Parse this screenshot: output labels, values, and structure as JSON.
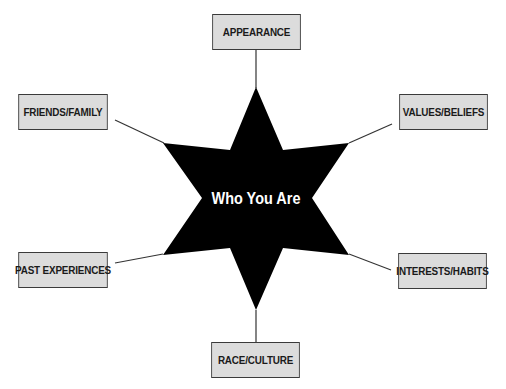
{
  "diagram": {
    "center": {
      "label": "Who You Are",
      "shape": "six-pointed-star",
      "fill": "#000000",
      "text_color": "#ffffff"
    },
    "nodes": [
      {
        "id": "appearance",
        "label": "APPEARANCE"
      },
      {
        "id": "friends-family",
        "label": "FRIENDS/FAMILY"
      },
      {
        "id": "values-beliefs",
        "label": "VALUES/BELIEFS"
      },
      {
        "id": "past-experiences",
        "label": "PAST EXPERIENCES"
      },
      {
        "id": "interests-habits",
        "label": "INTERESTS/HABITS"
      },
      {
        "id": "race-culture",
        "label": "RACE/CULTURE"
      }
    ],
    "colors": {
      "box_fill": "#dcdcdc",
      "box_border": "#3a3a3a",
      "line": "#333333"
    }
  }
}
